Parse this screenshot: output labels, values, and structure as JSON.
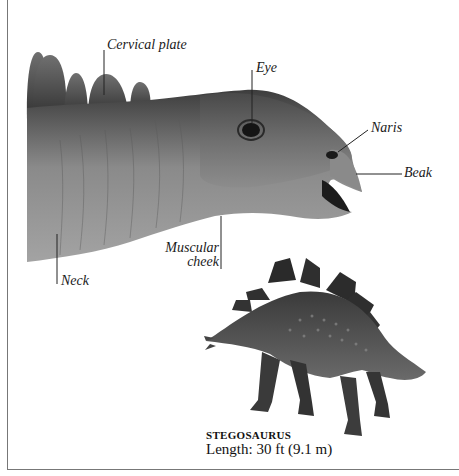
{
  "labels": {
    "cervical_plate": "Cervical plate",
    "eye": "Eye",
    "naris": "Naris",
    "beak": "Beak",
    "muscular_cheek_line1": "Muscular",
    "muscular_cheek_line2": "cheek",
    "neck": "Neck"
  },
  "caption": {
    "title": "STEGOSAURUS",
    "length": "Length: 30 ft (9.1 m)"
  },
  "colors": {
    "frame": "#777777",
    "text": "#1a1a1a",
    "skin_dark": "#3a3a3a",
    "skin_mid": "#6e6e6e",
    "skin_light": "#9a9a9a"
  }
}
